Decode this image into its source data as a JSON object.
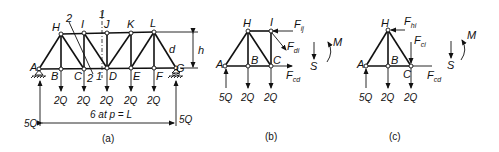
{
  "figure_a": {
    "caption": "(a)",
    "nodes": {
      "A": "A",
      "B": "B",
      "C": "C",
      "D": "D",
      "E": "E",
      "F": "F",
      "G": "G",
      "H": "H",
      "I": "I",
      "J": "J",
      "K": "K",
      "L": "L"
    },
    "section_labels": {
      "s1_top": "1",
      "s1_bot": "1",
      "s2_top": "2",
      "s2_bot": "2"
    },
    "member_label": "d",
    "height_label": "h",
    "loads": [
      "2Q",
      "2Q",
      "2Q",
      "2Q",
      "2Q"
    ],
    "reaction_left": "5Q",
    "reaction_right": "5Q",
    "span_label": "6 at p = L"
  },
  "figure_b": {
    "caption": "(b)",
    "nodes": {
      "A": "A",
      "B": "B",
      "C": "C",
      "H": "H",
      "I": "I"
    },
    "forces": {
      "fij": "F",
      "fij_sub": "ij",
      "fdi": "F",
      "fdi_sub": "di",
      "fcd": "F",
      "fcd_sub": "cd"
    },
    "shear": "S",
    "moment": "M",
    "loads": [
      "5Q",
      "2Q",
      "2Q"
    ]
  },
  "figure_c": {
    "caption": "(c)",
    "nodes": {
      "A": "A",
      "B": "B",
      "C": "C",
      "H": "H"
    },
    "forces": {
      "fhi": "F",
      "fhi_sub": "hi",
      "fci": "F",
      "fci_sub": "ci",
      "fcd": "F",
      "fcd_sub": "cd"
    },
    "shear": "S",
    "moment": "M",
    "loads": [
      "5Q",
      "2Q",
      "2Q"
    ]
  }
}
